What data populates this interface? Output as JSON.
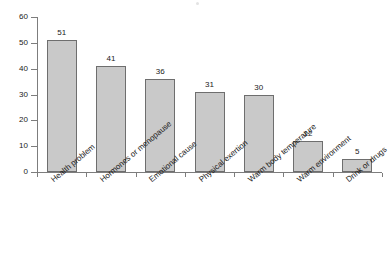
{
  "chart_data": {
    "type": "bar",
    "title": "",
    "subtitle": "",
    "xlabel": "",
    "ylabel": "",
    "categories": [
      "Health problem",
      "Hormones or menopause",
      "Emotional cause",
      "Physical exertion",
      "Warm body temperature",
      "Warm environment",
      "Drink or drugs"
    ],
    "values": [
      51,
      41,
      36,
      31,
      30,
      12,
      5
    ],
    "ylim": [
      0,
      60
    ],
    "yticks": [
      0,
      10,
      20,
      30,
      40,
      50,
      60
    ],
    "ytick_labels": [
      "0",
      "10",
      "20",
      "30",
      "40",
      "50",
      "60"
    ],
    "value_labels": [
      "51",
      "41",
      "36",
      "31",
      "30",
      "12",
      "5"
    ],
    "grid": false,
    "legend": false,
    "legend_position": "none",
    "bar_color": "#c9c9c9",
    "bar_border_color": "#6e6e6e",
    "axis_color": "#7d7d7d",
    "text_color": "#1a1a1a",
    "background": "#ffffff",
    "label_rotation_deg": -40
  }
}
